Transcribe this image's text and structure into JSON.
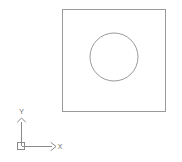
{
  "viewport": {
    "name": "cad-drawing-viewport",
    "background_color": "#ffffff",
    "width": 182,
    "height": 162
  },
  "drawing": {
    "title": "",
    "entities": [
      {
        "type": "rectangle",
        "name": "square-outline",
        "x": 62,
        "y": 9,
        "width": 103,
        "height": 102,
        "stroke_color": "#9a9a9a",
        "stroke_width": 1,
        "fill": "none"
      },
      {
        "type": "circle",
        "name": "inner-circle",
        "cx": 114,
        "cy": 57,
        "r": 24,
        "stroke_color": "#9a9a9a",
        "stroke_width": 1,
        "fill": "none"
      }
    ]
  },
  "ucs_icon": {
    "name": "ucs-coordinate-icon",
    "stroke_color": "#8a8a8a",
    "origin": {
      "x": 21,
      "y": 146
    },
    "origin_box": {
      "x": 17,
      "y": 142,
      "size": 7
    },
    "x_axis": {
      "label": "X",
      "label_x": 58,
      "label_y": 146,
      "line_from_x": 21,
      "line_to_x": 52,
      "line_y": 146,
      "arrow_tip_x": 55
    },
    "y_axis": {
      "label": "Y",
      "label_x": 21,
      "label_y": 113,
      "line_from_y": 146,
      "line_to_y": 122,
      "line_x": 21,
      "arrow_tip_y": 118
    }
  }
}
